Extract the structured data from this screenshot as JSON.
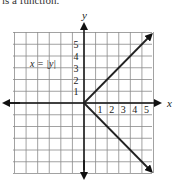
{
  "header": {
    "caption": "is a function."
  },
  "chart_data": {
    "type": "line",
    "title": "",
    "equation_label": "x = |y|",
    "xlabel": "x",
    "ylabel": "y",
    "xlim": [
      -6,
      6
    ],
    "ylim": [
      -6,
      6
    ],
    "grid": true,
    "x_ticks": [
      "1",
      "2",
      "3",
      "4",
      "5"
    ],
    "y_ticks": [
      "1",
      "2",
      "3",
      "4",
      "5"
    ],
    "series": [
      {
        "name": "x = |y| (upper branch)",
        "points": [
          [
            0,
            0
          ],
          [
            6,
            6
          ]
        ],
        "arrow_end": true
      },
      {
        "name": "x = |y| (lower branch)",
        "points": [
          [
            0,
            0
          ],
          [
            6,
            -6
          ]
        ],
        "arrow_end": true
      }
    ],
    "colors": {
      "grid": "#8a8a8a",
      "axes": "#111111",
      "curve": "#222222"
    }
  }
}
